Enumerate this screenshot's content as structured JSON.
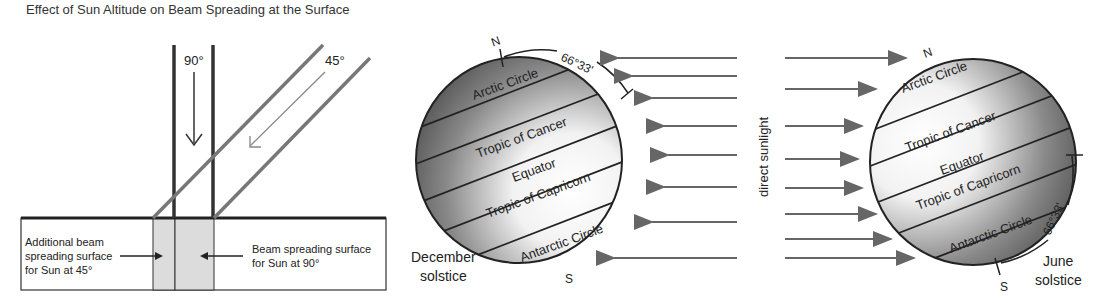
{
  "title": "Effect of Sun Altitude on Beam Spreading at the Surface",
  "beam_diagram": {
    "angle_vertical": "90°",
    "angle_oblique": "45°",
    "left_label": [
      "Additional beam",
      "spreading surface",
      "for Sun at 45°"
    ],
    "right_label": [
      "Beam spreading surface",
      "for Sun at 90°"
    ]
  },
  "december_globe": {
    "north": "N",
    "south": "S",
    "tilt_label": "66°33'",
    "lines": [
      "Arctic Circle",
      "Tropic of Cancer",
      "Equator",
      "Tropic of Capricorn",
      "Antarctic Circle"
    ],
    "caption": [
      "December",
      "solstice"
    ]
  },
  "sunlight_label": "direct sunlight",
  "june_globe": {
    "north": "N",
    "south": "S",
    "tilt_label": "66°33'",
    "lines": [
      "Arctic Circle",
      "Tropic of Cancer",
      "Equator",
      "Tropic of Capricorn",
      "Antarctic Circle"
    ],
    "caption": [
      "June",
      "solstice"
    ]
  },
  "colors": {
    "line": "#222222",
    "ray": "#666666",
    "shade": "#dcdcdc"
  }
}
